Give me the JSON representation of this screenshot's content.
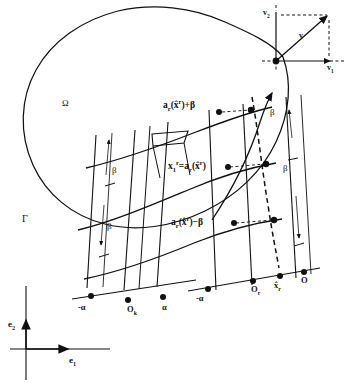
{
  "figure": {
    "domain_label": "Ω",
    "boundary_label": "Γ",
    "stroke_color": "#111111",
    "background_color": "#ffffff"
  },
  "labels": {
    "omega": "Ω",
    "gamma": "Γ",
    "beta": "β",
    "alpha": "α",
    "minus_alpha": "-α",
    "origin_k": "O",
    "origin_k_sub": "k",
    "origin_r": "O",
    "origin_r_sub": "r",
    "x_hat_r_axis": "x",
    "x_hat_r_axis_sub": "r",
    "e1": "e",
    "e1_sub": "1",
    "e2": "e",
    "e2_sub": "2",
    "v": "v",
    "v1": "v",
    "v1_sub": "1",
    "v2": "v",
    "v2_sub": "2"
  },
  "equations": {
    "upper": {
      "fn": "a",
      "fn_sub": "r",
      "arg_open": "(",
      "arg": "x",
      "arg_sup": "r",
      "arg_close": ")",
      "op": "+",
      "term": "β",
      "full": "a_r(x̂^r)+β"
    },
    "middle": {
      "lhs": "x",
      "lhs_sub": "1",
      "lhs_sup": "r",
      "eq": "=",
      "fn": "a",
      "fn_sub": "r",
      "arg_open": "(",
      "arg": "x",
      "arg_sup": "r",
      "arg_close": ")",
      "full": "x_1^r = a_r(x̂^r)"
    },
    "lower": {
      "fn": "a",
      "fn_sub": "r",
      "arg_open": "(",
      "arg": "x",
      "arg_sup": "r",
      "arg_close": ")",
      "op": "−",
      "term": "β",
      "full": "a_r(x̂^r)-β"
    }
  },
  "beta_markers": [
    {
      "id": "beta-left-upper",
      "text": "β"
    },
    {
      "id": "beta-left-lower",
      "text": "β"
    },
    {
      "id": "beta-right-upper",
      "text": "β"
    },
    {
      "id": "beta-right-lower",
      "text": "β"
    }
  ],
  "axis_ticks": {
    "left_segment": [
      "-α",
      "O",
      "α"
    ],
    "right_segment": [
      "-α",
      "O",
      "α"
    ]
  },
  "inset": {
    "name": "vector-decomposition",
    "vector_label": "v",
    "component_x_label": "v",
    "component_x_sub": "1",
    "component_y_label": "v",
    "component_y_sub": "2"
  },
  "basis": {
    "horizontal": "e",
    "horizontal_sub": "1",
    "vertical": "e",
    "vertical_sub": "2"
  }
}
